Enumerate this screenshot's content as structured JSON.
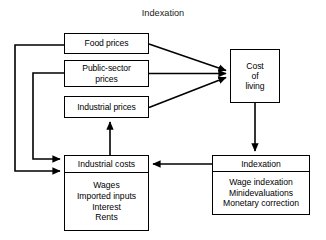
{
  "title": "Indexation",
  "nodes": {
    "food_prices": {
      "label": "Food prices"
    },
    "public_sector_prices": {
      "label": "Public-sector\nprices"
    },
    "industrial_prices": {
      "label": "Industrial prices"
    },
    "cost_of_living": {
      "label": "Cost\nof\nliving"
    },
    "industrial_costs": {
      "header": "Industrial costs",
      "items": "Wages\nImported inputs\nInterest\nRents"
    },
    "indexation": {
      "header": "Indexation",
      "items": "Wage indexation\nMinidevaluations\nMonetary correction"
    }
  },
  "edges": [
    {
      "name": "food-prices-to-cost-of-living",
      "from": "food_prices",
      "to": "cost_of_living"
    },
    {
      "name": "public-sector-prices-to-cost-of-living",
      "from": "public_sector_prices",
      "to": "cost_of_living"
    },
    {
      "name": "industrial-prices-to-cost-of-living",
      "from": "industrial_prices",
      "to": "cost_of_living"
    },
    {
      "name": "cost-of-living-to-indexation",
      "from": "cost_of_living",
      "to": "indexation"
    },
    {
      "name": "indexation-to-industrial-costs",
      "from": "indexation",
      "to": "industrial_costs"
    },
    {
      "name": "industrial-costs-to-industrial-prices",
      "from": "industrial_costs",
      "to": "industrial_prices"
    },
    {
      "name": "food-prices-feedback-to-industrial-costs",
      "from": "food_prices",
      "to": "industrial_costs"
    },
    {
      "name": "public-sector-prices-feedback-to-industrial-costs",
      "from": "public_sector_prices",
      "to": "industrial_costs"
    }
  ],
  "colors": {
    "stroke": "#000000",
    "background": "#ffffff",
    "text": "#000000"
  }
}
